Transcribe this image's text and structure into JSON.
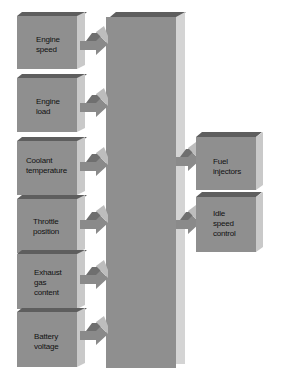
{
  "diagram": {
    "title": "",
    "colors": {
      "front": "#8f8f8f",
      "top": "#5e5e5e",
      "side": "#c9c9c9",
      "arrow": "#8a8a8a",
      "arrow_light": "#bdbdbd",
      "text": "#111111"
    },
    "inputs": [
      {
        "label": "Engine speed",
        "lines": [
          "Engine",
          "speed"
        ]
      },
      {
        "label": "Engine load",
        "lines": [
          "Engine",
          "load"
        ]
      },
      {
        "label": "Coolant temperature",
        "lines": [
          "Coolant",
          "temperature"
        ]
      },
      {
        "label": "Throttle position",
        "lines": [
          "Throttle",
          "position"
        ]
      },
      {
        "label": "Exhaust gas content",
        "lines": [
          "Exhaust",
          "gas",
          "content"
        ]
      },
      {
        "label": "Battery voltage",
        "lines": [
          "Battery",
          "voltage"
        ]
      }
    ],
    "controller": {
      "label": ""
    },
    "outputs": [
      {
        "label": "Fuel injectors",
        "lines": [
          "Fuel",
          "injectors"
        ]
      },
      {
        "label": "Idle speed control",
        "lines": [
          "Idle",
          "speed",
          "control"
        ]
      }
    ]
  }
}
